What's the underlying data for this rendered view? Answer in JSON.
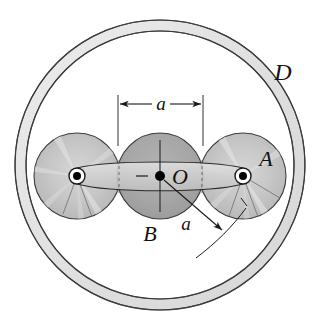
{
  "figure": {
    "type": "mechanism-diagram",
    "background_color": "#ffffff",
    "line_color": "#1a1a1a"
  },
  "labels": {
    "ring_D": "D",
    "roller_A": "A",
    "disk_B": "B",
    "center_O": "O",
    "dimension_a": "a",
    "radius_a": "a"
  },
  "colors": {
    "ring_fill": "#e3e3e3",
    "disk_fill": "#a9a9a9",
    "roller_fill": "#c9c9c9",
    "link_fill": "#d8d8d8",
    "pin_fill": "#ffffff",
    "pin_dot": "#000000",
    "outline": "#1a1a1a"
  },
  "geometry": {
    "ring_center_x": 160,
    "ring_center_y": 165,
    "ring_outer_radius": 145,
    "ring_inner_radius": 134,
    "disk_center_x": 160,
    "disk_center_y": 176,
    "disk_radius": 43,
    "roller_left_center_x": 77,
    "roller_right_center_x": 243,
    "roller_center_y": 176,
    "roller_radius": 43,
    "pin_outer_radius": 8,
    "pin_dot_radius": 4,
    "dimension_left_x": 118,
    "dimension_right_x": 203,
    "dimension_line_y": 104
  }
}
